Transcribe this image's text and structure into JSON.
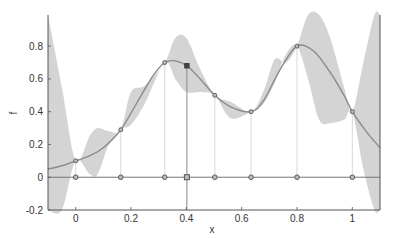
{
  "chart_data": {
    "type": "line",
    "title": "",
    "xlabel": "x",
    "ylabel": "f",
    "xlim": [
      -0.1,
      1.1
    ],
    "ylim": [
      -0.2,
      0.99
    ],
    "grid": false,
    "x_ticks": [
      "0",
      "0.2",
      "0.4",
      "0.6",
      "0.8",
      "1"
    ],
    "x_tick_values": [
      0,
      0.2,
      0.4,
      0.6,
      0.8,
      1
    ],
    "y_ticks": [
      "-0.2",
      "0",
      "0.2",
      "0.4",
      "0.6",
      "0.8"
    ],
    "y_tick_values": [
      -0.2,
      0,
      0.2,
      0.4,
      0.6,
      0.8
    ],
    "series": [
      {
        "name": "GP mean",
        "kind": "line",
        "x": [
          -0.1,
          -0.05,
          0,
          0.05,
          0.1,
          0.163,
          0.22,
          0.28,
          0.322,
          0.36,
          0.402,
          0.45,
          0.503,
          0.56,
          0.634,
          0.68,
          0.74,
          0.8,
          0.86,
          0.92,
          0.97,
          1.0,
          1.05,
          1.1
        ],
        "values": [
          0.05,
          0.07,
          0.1,
          0.13,
          0.18,
          0.29,
          0.45,
          0.62,
          0.7,
          0.71,
          0.68,
          0.6,
          0.5,
          0.43,
          0.4,
          0.47,
          0.66,
          0.8,
          0.77,
          0.64,
          0.5,
          0.4,
          0.28,
          0.18
        ]
      },
      {
        "name": "Confidence band",
        "kind": "area",
        "x": [
          -0.1,
          -0.05,
          0,
          0.05,
          0.08,
          0.12,
          0.163,
          0.2,
          0.25,
          0.322,
          0.36,
          0.4,
          0.45,
          0.503,
          0.56,
          0.634,
          0.68,
          0.72,
          0.76,
          0.8,
          0.84,
          0.88,
          0.92,
          0.97,
          1.0,
          1.04,
          1.08,
          1.1
        ],
        "upper": [
          0.99,
          0.55,
          0.1,
          0.25,
          0.3,
          0.28,
          0.29,
          0.52,
          0.56,
          0.7,
          0.85,
          0.85,
          0.66,
          0.5,
          0.46,
          0.4,
          0.53,
          0.72,
          0.7,
          0.8,
          0.99,
          0.99,
          0.85,
          0.55,
          0.4,
          0.7,
          0.99,
          0.99
        ],
        "lower": [
          -0.2,
          -0.2,
          0.1,
          0.02,
          0.02,
          0.2,
          0.29,
          0.32,
          0.45,
          0.7,
          0.6,
          0.52,
          0.52,
          0.5,
          0.36,
          0.4,
          0.45,
          0.58,
          0.75,
          0.8,
          0.6,
          0.35,
          0.33,
          0.35,
          0.4,
          0.05,
          -0.2,
          -0.2
        ]
      },
      {
        "name": "Observations",
        "kind": "scatter",
        "marker": "circle",
        "x": [
          0,
          0.163,
          0.322,
          0.503,
          0.634,
          0.8,
          1.0
        ],
        "values": [
          0.1,
          0.29,
          0.7,
          0.5,
          0.4,
          0.8,
          0.4
        ]
      },
      {
        "name": "Next query",
        "kind": "scatter",
        "marker": "square",
        "x": [
          0.402
        ],
        "values": [
          0.68
        ]
      },
      {
        "name": "Sample locations",
        "kind": "scatter",
        "marker": "circle",
        "x": [
          0,
          0.163,
          0.322,
          0.402,
          0.503,
          0.634,
          0.8,
          1.0
        ],
        "values": [
          0,
          0,
          0,
          0,
          0,
          0,
          0,
          0
        ]
      }
    ],
    "colors": {
      "mean_line": "#8a8a8a",
      "band_fill": "#d4d4d4",
      "markers": "#555555",
      "axis": "#555555",
      "vertical_guides": "#cfcfcf",
      "query_line": "#888888"
    }
  }
}
